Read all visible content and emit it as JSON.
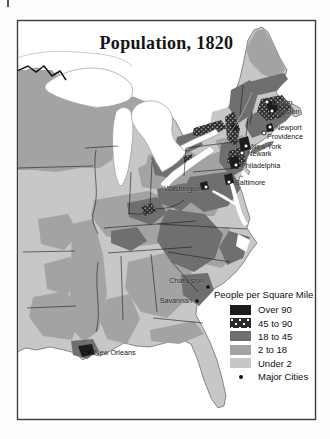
{
  "title": "Population, 1820",
  "legend": {
    "title": "People per Square Mile",
    "items": [
      {
        "label": "Over 90",
        "color": "#1c1c1c",
        "style": "solid"
      },
      {
        "label": "45 to 90",
        "color": "#2b2b2b",
        "style": "stipple"
      },
      {
        "label": "18 to 45",
        "color": "#6f6f6f",
        "style": "solid"
      },
      {
        "label": "2 to 18",
        "color": "#a3a3a3",
        "style": "solid"
      },
      {
        "label": "Under 2",
        "color": "#c7c7c7",
        "style": "solid"
      },
      {
        "label": "Major Cities",
        "color": "#111111",
        "style": "dot"
      }
    ]
  },
  "cities": [
    {
      "name": "Salem"
    },
    {
      "name": "Boston"
    },
    {
      "name": "Newport"
    },
    {
      "name": "Providence"
    },
    {
      "name": "New York"
    },
    {
      "name": "Newark"
    },
    {
      "name": "Philadelphia"
    },
    {
      "name": "Baltimore"
    },
    {
      "name": "Washington"
    },
    {
      "name": "Charleston"
    },
    {
      "name": "Savannah"
    },
    {
      "name": "New Orleans"
    }
  ],
  "palette": {
    "over_90": "#1c1c1c",
    "stipple_bg": "#2b2b2b",
    "d18_45": "#6f6f6f",
    "d2_18": "#a3a3a3",
    "under_2": "#c7c7c7",
    "water": "#ffffff",
    "frame": "#3c3c3c"
  }
}
